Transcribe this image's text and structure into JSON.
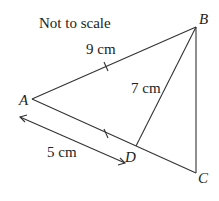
{
  "note": "Not to scale",
  "points": {
    "A": {
      "label": "A",
      "x": 32,
      "y": 99
    },
    "B": {
      "label": "B",
      "x": 196,
      "y": 27
    },
    "C": {
      "label": "C",
      "x": 196,
      "y": 173
    },
    "D": {
      "label": "D",
      "x": 136,
      "y": 146
    }
  },
  "measurements": {
    "AB": "9 cm",
    "BD": "7 cm",
    "AD": "5 cm"
  },
  "colors": {
    "line": "#333333",
    "text": "#222222"
  }
}
